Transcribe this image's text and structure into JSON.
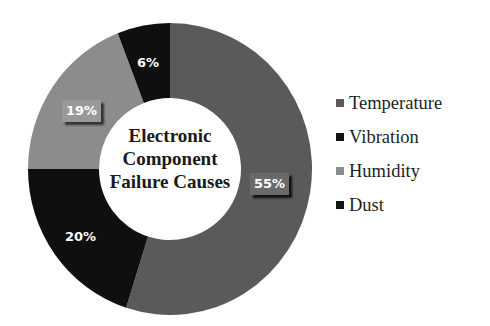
{
  "chart_data": {
    "type": "pie",
    "variant": "donut",
    "title": "Electronic Component Failure Causes",
    "title_lines": [
      "Electronic",
      "Component",
      "Failure Causes"
    ],
    "categories": [
      "Temperature",
      "Vibration",
      "Humidity",
      "Dust"
    ],
    "values": [
      55,
      20,
      19,
      6
    ],
    "value_labels": [
      "55%",
      "20%",
      "19%",
      "6%"
    ],
    "colors": [
      "#5a5a5a",
      "#0f0f0f",
      "#8c8c8c",
      "#0f0f0f"
    ],
    "legend_position": "right",
    "start_angle_deg": 0,
    "direction": "clockwise"
  },
  "legend": {
    "items": [
      {
        "label": "Temperature",
        "color": "#5a5a5a"
      },
      {
        "label": "Vibration",
        "color": "#141414"
      },
      {
        "label": "Humidity",
        "color": "#8c8c8c"
      },
      {
        "label": "Dust",
        "color": "#141414"
      }
    ]
  }
}
